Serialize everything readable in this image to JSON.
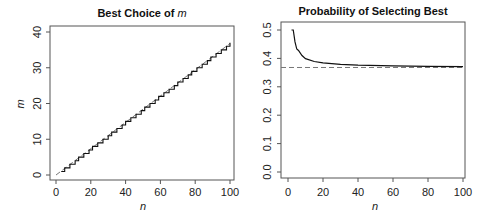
{
  "chart_data": [
    {
      "type": "line",
      "title": "Best Choice of ",
      "title_italic": "m",
      "xlabel": "n",
      "ylabel": "m",
      "xlim": [
        0,
        100
      ],
      "ylim": [
        0,
        40
      ],
      "xticks": [
        0,
        20,
        40,
        60,
        80,
        100
      ],
      "yticks": [
        0,
        10,
        20,
        30,
        40
      ],
      "grid": false,
      "series": [
        {
          "name": "optimal m (step)",
          "style": "solid",
          "description": "round-ish step function of n/e, from n=3 to n=100"
        },
        {
          "name": "n/e",
          "style": "dashed",
          "x": [
            0,
            100
          ],
          "y": [
            0,
            36.8
          ]
        }
      ]
    },
    {
      "type": "line",
      "title": "Probability of Selecting Best",
      "xlabel": "n",
      "ylabel": "",
      "xlim": [
        0,
        100
      ],
      "ylim": [
        0,
        0.5
      ],
      "xticks": [
        0,
        20,
        40,
        60,
        80,
        100
      ],
      "yticks": [
        0.0,
        0.1,
        0.2,
        0.3,
        0.4,
        0.5
      ],
      "grid": false,
      "series": [
        {
          "name": "P(best)",
          "style": "solid",
          "x": [
            2,
            3,
            4,
            5,
            6,
            8,
            10,
            15,
            20,
            30,
            40,
            60,
            80,
            100
          ],
          "y": [
            0.5,
            0.5,
            0.458,
            0.433,
            0.428,
            0.41,
            0.399,
            0.389,
            0.384,
            0.379,
            0.376,
            0.374,
            0.372,
            0.371
          ]
        },
        {
          "name": "1/e",
          "style": "dashed",
          "x": [
            0,
            100
          ],
          "y": [
            0.368,
            0.368
          ]
        }
      ]
    }
  ]
}
